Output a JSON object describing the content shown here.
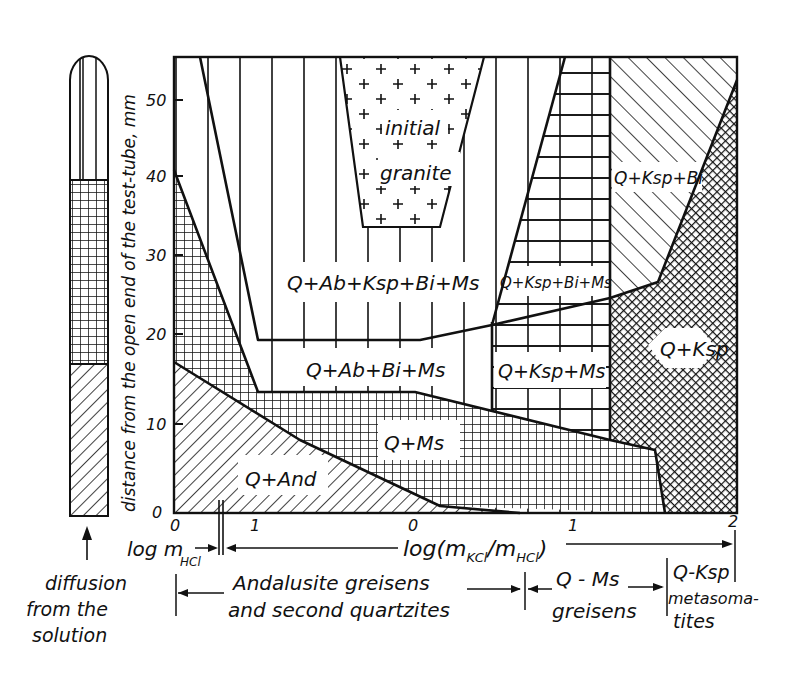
{
  "figure": {
    "y_axis": {
      "label": "distance from the open end of the test-tube, mm",
      "ticks": [
        "0",
        "10",
        "20",
        "30",
        "40",
        "50"
      ],
      "range": [
        0,
        55
      ]
    },
    "x_axis": {
      "left_segment": {
        "label_main": "log m",
        "label_sub": "HCl",
        "ticks": [
          "0",
          "1"
        ]
      },
      "right_segment": {
        "label": "log(m",
        "label_sub1": "KCl",
        "label_mid": "/m",
        "label_sub2": "HCl",
        "label_end": ")",
        "ticks": [
          "0",
          "1",
          "2"
        ]
      }
    },
    "regions": {
      "initial_granite_line1": "initial",
      "initial_granite_line2": "granite",
      "q_ab_ksp_bi_ms": "Q+Ab+Ksp+Bi+Ms",
      "q_ab_bi_ms": "Q+Ab+Bi+Ms",
      "q_ms": "Q+Ms",
      "q_and": "Q+And",
      "q_ksp_bi_ms": "Q+Ksp+Bi+Ms",
      "q_ksp_ms": "Q+Ksp+Ms",
      "q_ksp_bi": "Q+Ksp+Bi",
      "q_ksp": "Q+Ksp"
    },
    "tube": {
      "caption_line1": "diffusion",
      "caption_line2": "from the",
      "caption_line3": "solution"
    },
    "zones": {
      "andalusite_line1": "Andalusite greisens",
      "andalusite_line2": "and second quartzites",
      "qms_line1": "Q - Ms",
      "qms_line2": "greisens",
      "qksp_line1": "Q-Ksp",
      "qksp_line2": "metasoma-",
      "qksp_line3": "tites"
    }
  }
}
